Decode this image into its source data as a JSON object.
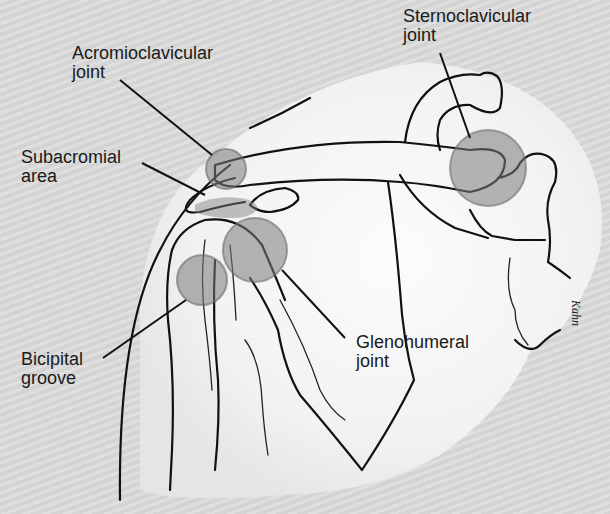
{
  "diagram": {
    "labels": {
      "acromioclavicular": "Acromioclavicular\njoint",
      "sternoclavicular": "Sternoclavicular\njoint",
      "subacromial": "Subacromial\narea",
      "glenohumeral": "Glenohumeral\njoint",
      "bicipital": "Bicipital\ngroove"
    },
    "signature": "Kahn"
  },
  "colors": {
    "background": "#d8d8d8",
    "body_highlight": "#ffffff",
    "joint_fill": "#7a7a7a",
    "outline": "#111111"
  }
}
